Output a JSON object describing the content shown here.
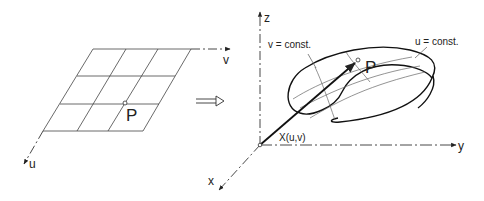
{
  "parameter_domain": {
    "axis_u_label": "u",
    "axis_v_label": "v",
    "point_label": "P",
    "grid_rows": 3,
    "grid_cols": 3
  },
  "mapping_arrow": {
    "symbol": "double-arrow-right-icon"
  },
  "surface_space": {
    "axis_x_label": "x",
    "axis_y_label": "y",
    "axis_z_label": "z",
    "point_label": "P",
    "position_vector_label": "X(u,v)",
    "curve_v_const_label": "v = const.",
    "curve_u_const_label": "u = const."
  },
  "colors": {
    "line": "#222222",
    "thin_line": "#555555",
    "background": "#ffffff"
  }
}
